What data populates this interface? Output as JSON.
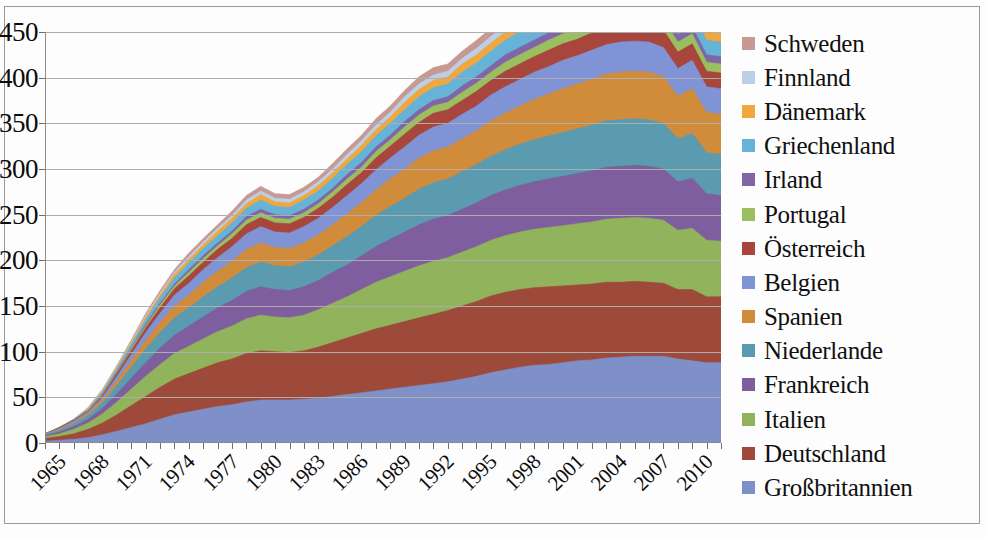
{
  "chart_data": {
    "type": "area",
    "stacked": true,
    "title": "",
    "xlabel": "",
    "ylabel": "",
    "ylim": [
      0,
      450
    ],
    "ytick_labels": [
      "450",
      "400",
      "350",
      "300",
      "250",
      "200",
      "150",
      "100",
      "50",
      "0"
    ],
    "ytick_values": [
      450,
      400,
      350,
      300,
      250,
      200,
      150,
      100,
      50,
      0
    ],
    "xtick_labels": [
      "1965",
      "1968",
      "1971",
      "1974",
      "1977",
      "1980",
      "1983",
      "1986",
      "1989",
      "1992",
      "1995",
      "1998",
      "2001",
      "2004",
      "2007",
      "2010"
    ],
    "xtick_values": [
      1965,
      1968,
      1971,
      1974,
      1977,
      1980,
      1983,
      1986,
      1989,
      1992,
      1995,
      1998,
      2001,
      2004,
      2007,
      2010
    ],
    "xlim": [
      1965,
      2012
    ],
    "grid": true,
    "legend_position": "right",
    "x": [
      1965,
      1966,
      1967,
      1968,
      1969,
      1970,
      1971,
      1972,
      1973,
      1974,
      1975,
      1976,
      1977,
      1978,
      1979,
      1980,
      1981,
      1982,
      1983,
      1984,
      1985,
      1986,
      1987,
      1988,
      1989,
      1990,
      1991,
      1992,
      1993,
      1994,
      1995,
      1996,
      1997,
      1998,
      1999,
      2000,
      2001,
      2002,
      2003,
      2004,
      2005,
      2006,
      2007,
      2008,
      2009,
      2010,
      2011,
      2012
    ],
    "series": [
      {
        "name": "Großbritannien",
        "color": "#7F8FC7",
        "values": [
          2,
          3,
          4,
          6,
          9,
          13,
          17,
          21,
          26,
          31,
          34,
          37,
          40,
          42,
          45,
          47,
          47,
          47,
          48,
          49,
          51,
          53,
          55,
          57,
          59,
          61,
          63,
          65,
          67,
          70,
          73,
          77,
          80,
          83,
          85,
          86,
          88,
          90,
          91,
          93,
          94,
          95,
          95,
          95,
          92,
          90,
          88,
          88
        ]
      },
      {
        "name": "Deutschland",
        "color": "#9E4A3B",
        "values": [
          3,
          4,
          6,
          9,
          13,
          18,
          24,
          30,
          35,
          39,
          42,
          45,
          48,
          50,
          53,
          54,
          53,
          52,
          53,
          56,
          59,
          62,
          65,
          68,
          70,
          72,
          74,
          76,
          78,
          80,
          82,
          84,
          85,
          85,
          85,
          85,
          84,
          83,
          83,
          83,
          82,
          82,
          81,
          80,
          76,
          78,
          72,
          72
        ]
      },
      {
        "name": "Italien",
        "color": "#90B35B",
        "values": [
          2,
          3,
          5,
          7,
          10,
          14,
          18,
          22,
          25,
          28,
          30,
          32,
          34,
          36,
          38,
          39,
          38,
          38,
          39,
          41,
          43,
          45,
          48,
          51,
          53,
          55,
          57,
          58,
          58,
          59,
          60,
          61,
          62,
          63,
          64,
          65,
          66,
          67,
          68,
          69,
          70,
          70,
          70,
          69,
          65,
          67,
          62,
          61
        ]
      },
      {
        "name": "Frankreich",
        "color": "#7F5EA0",
        "values": [
          1,
          2,
          3,
          4,
          6,
          9,
          12,
          15,
          18,
          20,
          22,
          24,
          26,
          28,
          30,
          31,
          30,
          30,
          31,
          32,
          34,
          35,
          37,
          39,
          41,
          43,
          45,
          46,
          46,
          47,
          48,
          49,
          50,
          51,
          52,
          53,
          54,
          55,
          56,
          57,
          57,
          57,
          57,
          56,
          53,
          55,
          51,
          50
        ]
      },
      {
        "name": "Niederlande",
        "color": "#5B9BB0",
        "values": [
          1,
          2,
          3,
          4,
          6,
          9,
          12,
          15,
          17,
          19,
          20,
          22,
          23,
          25,
          26,
          27,
          26,
          26,
          27,
          28,
          29,
          31,
          32,
          34,
          36,
          37,
          39,
          40,
          40,
          41,
          42,
          43,
          44,
          45,
          46,
          47,
          48,
          49,
          50,
          51,
          51,
          51,
          51,
          50,
          47,
          49,
          45,
          45
        ]
      },
      {
        "name": "Spanien",
        "color": "#D08C3A",
        "values": [
          0,
          1,
          1,
          2,
          3,
          5,
          7,
          9,
          11,
          13,
          14,
          16,
          17,
          18,
          20,
          21,
          20,
          20,
          21,
          22,
          23,
          25,
          26,
          28,
          30,
          32,
          34,
          35,
          35,
          36,
          37,
          39,
          40,
          42,
          44,
          46,
          48,
          49,
          50,
          51,
          52,
          52,
          52,
          51,
          47,
          49,
          44,
          44
        ]
      },
      {
        "name": "Belgien",
        "color": "#7F93D5",
        "values": [
          1,
          1,
          2,
          2,
          3,
          5,
          7,
          9,
          10,
          12,
          13,
          14,
          15,
          16,
          17,
          18,
          17,
          17,
          18,
          18,
          19,
          20,
          21,
          22,
          23,
          24,
          25,
          26,
          26,
          27,
          27,
          28,
          29,
          29,
          30,
          30,
          31,
          31,
          32,
          32,
          33,
          33,
          33,
          32,
          30,
          31,
          28,
          28
        ]
      },
      {
        "name": "Österreich",
        "color": "#A8453C",
        "values": [
          0,
          1,
          1,
          1,
          2,
          3,
          4,
          5,
          6,
          7,
          8,
          8,
          9,
          9,
          10,
          10,
          10,
          10,
          10,
          11,
          11,
          12,
          12,
          13,
          13,
          14,
          14,
          15,
          15,
          15,
          16,
          16,
          17,
          17,
          17,
          18,
          18,
          18,
          19,
          19,
          19,
          19,
          19,
          19,
          18,
          18,
          17,
          17
        ]
      },
      {
        "name": "Portugal",
        "color": "#9BBE5E",
        "values": [
          0,
          0,
          0,
          1,
          1,
          1,
          2,
          2,
          3,
          3,
          4,
          4,
          4,
          5,
          5,
          5,
          5,
          5,
          5,
          5,
          6,
          6,
          6,
          7,
          7,
          8,
          8,
          8,
          8,
          9,
          9,
          9,
          10,
          10,
          10,
          11,
          11,
          11,
          12,
          12,
          12,
          12,
          12,
          12,
          11,
          11,
          10,
          10
        ]
      },
      {
        "name": "Irland",
        "color": "#8066A8",
        "values": [
          0,
          0,
          0,
          0,
          1,
          1,
          1,
          2,
          2,
          2,
          3,
          3,
          3,
          3,
          4,
          4,
          4,
          4,
          4,
          4,
          4,
          5,
          5,
          5,
          5,
          6,
          6,
          6,
          6,
          7,
          7,
          7,
          8,
          8,
          8,
          8,
          9,
          9,
          9,
          9,
          9,
          9,
          9,
          9,
          8,
          8,
          8,
          8
        ]
      },
      {
        "name": "Griechenland",
        "color": "#67B3D8",
        "values": [
          0,
          0,
          1,
          1,
          2,
          3,
          4,
          5,
          6,
          7,
          7,
          8,
          8,
          9,
          9,
          10,
          9,
          9,
          10,
          10,
          11,
          11,
          12,
          12,
          13,
          13,
          14,
          14,
          14,
          15,
          15,
          16,
          16,
          17,
          17,
          17,
          18,
          18,
          18,
          19,
          19,
          19,
          19,
          18,
          17,
          17,
          16,
          16
        ]
      },
      {
        "name": "Dänemark",
        "color": "#F0A73D",
        "values": [
          0,
          0,
          0,
          1,
          1,
          2,
          2,
          3,
          3,
          4,
          4,
          4,
          5,
          5,
          5,
          6,
          5,
          5,
          5,
          6,
          6,
          6,
          7,
          7,
          7,
          8,
          8,
          8,
          8,
          9,
          9,
          9,
          9,
          10,
          10,
          10,
          10,
          10,
          11,
          11,
          11,
          11,
          11,
          11,
          10,
          10,
          9,
          9
        ]
      },
      {
        "name": "Finnland",
        "color": "#BBD0E8",
        "values": [
          0,
          0,
          0,
          0,
          1,
          1,
          1,
          2,
          2,
          2,
          3,
          3,
          3,
          3,
          4,
          4,
          4,
          4,
          4,
          4,
          4,
          5,
          5,
          5,
          5,
          6,
          6,
          6,
          6,
          6,
          7,
          7,
          7,
          7,
          8,
          8,
          8,
          8,
          8,
          9,
          9,
          9,
          9,
          9,
          8,
          8,
          7,
          7
        ]
      },
      {
        "name": "Schweden",
        "color": "#C69A93",
        "values": [
          0,
          0,
          0,
          1,
          1,
          1,
          2,
          2,
          3,
          3,
          4,
          4,
          4,
          5,
          5,
          5,
          5,
          5,
          5,
          5,
          6,
          6,
          6,
          7,
          7,
          7,
          8,
          8,
          8,
          8,
          9,
          9,
          9,
          10,
          10,
          10,
          10,
          11,
          11,
          11,
          11,
          11,
          11,
          11,
          10,
          10,
          9,
          9
        ]
      }
    ]
  },
  "legend": {
    "items": [
      {
        "label": "Schweden",
        "color": "#C69A93"
      },
      {
        "label": "Finnland",
        "color": "#BBD0E8"
      },
      {
        "label": "Dänemark",
        "color": "#F0A73D"
      },
      {
        "label": "Griechenland",
        "color": "#67B3D8"
      },
      {
        "label": "Irland",
        "color": "#8066A8"
      },
      {
        "label": "Portugal",
        "color": "#9BBE5E"
      },
      {
        "label": "Österreich",
        "color": "#A8453C"
      },
      {
        "label": "Belgien",
        "color": "#7F93D5"
      },
      {
        "label": "Spanien",
        "color": "#D08C3A"
      },
      {
        "label": "Niederlande",
        "color": "#5B9BB0"
      },
      {
        "label": "Frankreich",
        "color": "#7F5EA0"
      },
      {
        "label": "Italien",
        "color": "#90B35B"
      },
      {
        "label": "Deutschland",
        "color": "#9E4A3B"
      },
      {
        "label": "Großbritannien",
        "color": "#7F8FC7"
      }
    ]
  }
}
